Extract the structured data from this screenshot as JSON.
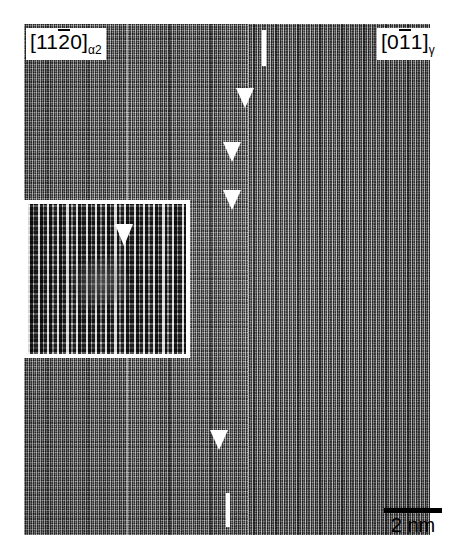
{
  "figure": {
    "type": "HRTEM micrograph",
    "background_color": "#ffffff"
  },
  "labels": {
    "left_zone_axis": {
      "full": "[1120]a2",
      "bracket_open": "[",
      "indices_before_bar": "11",
      "index_with_overbar": "2",
      "indices_after_bar": "0",
      "bracket_close": "]",
      "subscript": "α2",
      "phase": "alpha-2",
      "color": "#000000"
    },
    "right_zone_axis": {
      "full": "[011]g",
      "bracket_open": "[",
      "indices_before_bar": "0",
      "index_with_overbar": "1",
      "indices_after_bar": "1",
      "bracket_close": "]",
      "subscript": "γ",
      "phase": "gamma",
      "color": "#000000"
    }
  },
  "scale_bar": {
    "label": "2 nm",
    "value": 2,
    "unit": "nm",
    "bar_color": "#000000",
    "text_color": "#000000"
  },
  "regions": {
    "left": {
      "name": "alpha2-lattice-region",
      "phase": "α2",
      "pattern": "cross-hatched rectangular lattice fringes"
    },
    "right": {
      "name": "gamma-lattice-region",
      "phase": "γ",
      "pattern": "fine vertical lattice fringes"
    }
  },
  "markers": {
    "arrowhead_color": "#ffffff",
    "tick_color": "#ffffff",
    "count": 4,
    "arrowheads": [
      {
        "id": "arrowhead-1",
        "x": 236,
        "y": 88
      },
      {
        "id": "arrowhead-2",
        "x": 223,
        "y": 142
      },
      {
        "id": "arrowhead-3",
        "x": 223,
        "y": 190
      },
      {
        "id": "arrowhead-4",
        "x": 210,
        "y": 430
      }
    ],
    "ticks": [
      {
        "id": "interface-tick-top",
        "x": 262,
        "y": 30,
        "height": 36
      },
      {
        "id": "interface-tick-bottom",
        "x": 226,
        "y": 493,
        "height": 34
      }
    ]
  },
  "inset": {
    "name": "magnified-inset",
    "border_color": "#ffffff",
    "description": "magnified view of interface core showing bright atomic columns and a misfit dislocation",
    "arrowhead_color": "#ffffff"
  },
  "stamp": {
    "text": ""
  }
}
